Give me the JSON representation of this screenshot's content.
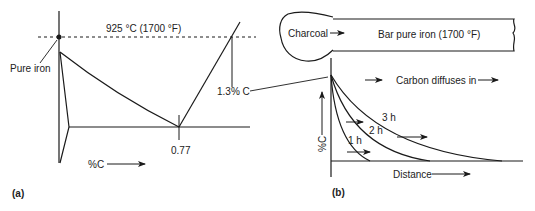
{
  "panel_a": {
    "label": "(a)",
    "temperature_label": "925 °C (1700 °F)",
    "pure_iron_label": "Pure iron",
    "eutectoid_label": "0.77",
    "carbon_limit_label": "1.3% C",
    "x_axis_label": "%C"
  },
  "panel_b": {
    "label": "(b)",
    "charcoal_label": "Charcoal",
    "bar_label": "Bar pure iron (1700 °F)",
    "diffusion_label": "Carbon diffuses in",
    "y_axis_label": "%C",
    "x_axis_label": "Distance",
    "curves": [
      {
        "label": "1 h"
      },
      {
        "label": "2 h"
      },
      {
        "label": "3 h"
      }
    ]
  },
  "colors": {
    "line": "#1a1a1a",
    "text": "#222222",
    "background": "#ffffff"
  }
}
